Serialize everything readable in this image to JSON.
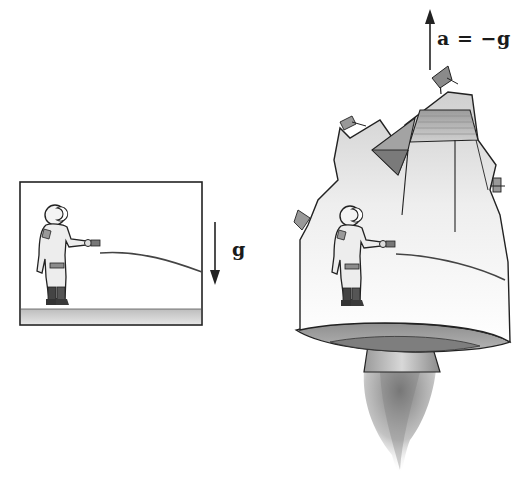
{
  "figure": {
    "left_panel": {
      "description": "astronaut standing on ground in gravitational field, hose stream curving downward",
      "gravity_label": "g",
      "gravity_arrow_direction": "down"
    },
    "right_panel": {
      "description": "astronaut inside accelerating rocket, hose stream curving downward identically",
      "acceleration_label": "a = −g",
      "acceleration_arrow_direction": "up"
    },
    "colors": {
      "ink": "#1a1a1a",
      "ground": "#c8c8c8",
      "hull_light": "#f2f2f2",
      "hull_shade": "#a8a8a8",
      "exhaust": "#8a8a8a"
    }
  }
}
